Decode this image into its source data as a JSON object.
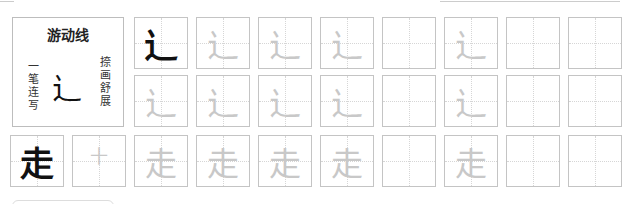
{
  "header": {
    "title": "游动线",
    "left_caption": [
      "一",
      "笔",
      "连",
      "写"
    ],
    "right_caption": [
      "捺",
      "画",
      "舒",
      "展"
    ],
    "example_glyph": "辶"
  },
  "colors": {
    "ink": "#111111",
    "trace": "#c8c8c8",
    "grid": "#c4c4c4"
  },
  "rows": [
    {
      "start_x": 134,
      "top": 17,
      "cells": [
        {
          "glyph": "辶",
          "style": "ink"
        },
        {
          "glyph": "辶",
          "style": "trace"
        },
        {
          "glyph": "辶",
          "style": "trace"
        },
        {
          "glyph": "辶",
          "style": "trace"
        },
        {
          "glyph": "",
          "style": "empty"
        },
        {
          "glyph": "辶",
          "style": "trace"
        },
        {
          "glyph": "",
          "style": "empty"
        },
        {
          "glyph": "",
          "style": "empty"
        }
      ]
    },
    {
      "start_x": 134,
      "top": 75,
      "cells": [
        {
          "glyph": "辶",
          "style": "trace"
        },
        {
          "glyph": "辶",
          "style": "trace"
        },
        {
          "glyph": "辶",
          "style": "trace"
        },
        {
          "glyph": "辶",
          "style": "trace"
        },
        {
          "glyph": "",
          "style": "empty"
        },
        {
          "glyph": "辶",
          "style": "trace"
        },
        {
          "glyph": "",
          "style": "empty"
        },
        {
          "glyph": "",
          "style": "empty"
        }
      ]
    },
    {
      "start_x": 10,
      "top": 135,
      "cells": [
        {
          "glyph": "走",
          "style": "ink"
        },
        {
          "glyph": "十",
          "style": "trace-small"
        },
        {
          "glyph": "走",
          "style": "trace"
        },
        {
          "glyph": "走",
          "style": "trace"
        },
        {
          "glyph": "走",
          "style": "trace"
        },
        {
          "glyph": "走",
          "style": "trace"
        },
        {
          "glyph": "",
          "style": "empty"
        },
        {
          "glyph": "走",
          "style": "trace"
        },
        {
          "glyph": "",
          "style": "empty"
        },
        {
          "glyph": "",
          "style": "empty"
        }
      ]
    }
  ]
}
